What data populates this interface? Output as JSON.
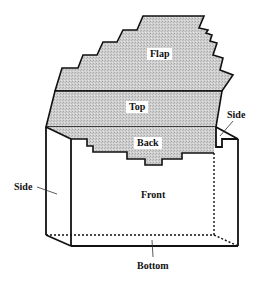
{
  "diagram": {
    "colors": {
      "outline": "#111111",
      "shaded_fill": "#c9c9c9",
      "background": "#ffffff"
    },
    "labels": {
      "flap": "Flap",
      "top": "Top",
      "back": "Back",
      "side_right": "Side",
      "side_left": "Side",
      "front": "Front",
      "bottom": "Bottom"
    },
    "panels": [
      {
        "id": "flap",
        "shaded": true
      },
      {
        "id": "top",
        "shaded": true
      },
      {
        "id": "back",
        "shaded": true
      },
      {
        "id": "side_left",
        "shaded": false
      },
      {
        "id": "side_right",
        "shaded": false
      },
      {
        "id": "front",
        "shaded": false
      },
      {
        "id": "bottom",
        "shaded": false,
        "hidden_edges": "dashed"
      }
    ]
  }
}
